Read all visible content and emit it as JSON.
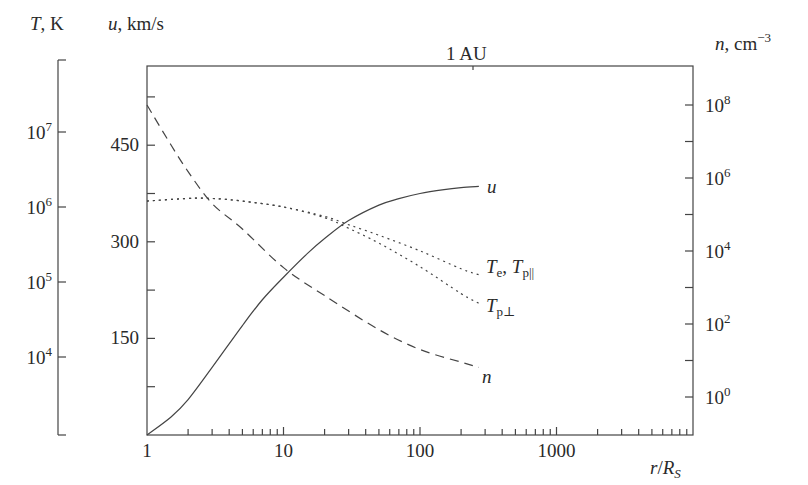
{
  "chart_data": {
    "type": "line",
    "title": "",
    "xlabel": "r/R_S",
    "x_scale": "log",
    "xlim": [
      1,
      10000
    ],
    "x_ticks": [
      "1",
      "10",
      "100",
      "1000"
    ],
    "top_marker": {
      "label": "1 AU",
      "x": 215
    },
    "axes": {
      "T": {
        "label": "T, K",
        "scale": "log",
        "ticks": [
          "10^7",
          "10^6",
          "10^5",
          "10^4"
        ],
        "range": [
          1000,
          100000000
        ]
      },
      "u": {
        "label": "u, km/s",
        "scale": "linear",
        "ticks": [
          "450",
          "300",
          "150"
        ],
        "minor_ticks": [
          75,
          225,
          375,
          525
        ],
        "range": [
          0,
          560
        ]
      },
      "n": {
        "label": "n, cm^-3",
        "scale": "log",
        "ticks": [
          "10^8",
          "10^6",
          "10^4",
          "10^2",
          "10^0"
        ],
        "range": [
          0.1,
          1000000000
        ]
      }
    },
    "series": [
      {
        "name": "u",
        "label": "u",
        "axis": "u",
        "style": "solid",
        "x": [
          1,
          1.5,
          2,
          3,
          5,
          7,
          10,
          15,
          20,
          30,
          50,
          70,
          100,
          150,
          200,
          270
        ],
        "values": [
          0,
          28,
          55,
          105,
          170,
          210,
          245,
          282,
          305,
          333,
          357,
          367,
          375,
          381,
          384,
          386
        ]
      },
      {
        "name": "n",
        "label": "n",
        "axis": "n",
        "style": "dashed",
        "x": [
          1,
          1.5,
          2,
          3,
          5,
          10,
          20,
          50,
          100,
          200,
          270
        ],
        "values": [
          100000000,
          8000000,
          1500000,
          200000,
          40000,
          3500,
          600,
          70,
          20,
          9,
          6.5
        ]
      },
      {
        "name": "Te, Tp_par",
        "label": "T_e, T_p||",
        "axis": "T",
        "style": "dotted",
        "x": [
          1,
          2,
          3,
          5,
          10,
          20,
          30,
          50,
          100,
          200,
          270
        ],
        "values": [
          1200000,
          1300000,
          1300000,
          1200000,
          1000000,
          750000,
          580000,
          420000,
          260000,
          150000,
          125000
        ]
      },
      {
        "name": "Tp_perp",
        "label": "T_p⊥",
        "axis": "T",
        "style": "dotted",
        "x": [
          1,
          2,
          3,
          5,
          10,
          20,
          30,
          50,
          100,
          200,
          270
        ],
        "values": [
          1200000,
          1300000,
          1300000,
          1200000,
          1000000,
          720000,
          520000,
          330000,
          160000,
          70000,
          52000
        ]
      }
    ],
    "grid": false,
    "legend": "inline labels at curve ends",
    "labels": {
      "T_axis_title_var": "T",
      "T_axis_title_unit": ", K",
      "u_axis_title_var": "u",
      "u_axis_title_unit": ", km/s",
      "n_axis_title_var": "n",
      "n_axis_title_unit": ", cm",
      "n_axis_title_exp": "−3",
      "x_axis_r": "r",
      "x_axis_slash": "/",
      "x_axis_R": "R",
      "x_axis_sub": "S",
      "au": "1 AU",
      "u_curve": "u",
      "n_curve": "n",
      "Te_T": "T",
      "Te_sub": "e",
      "Te_comma": ", ",
      "Tp_T": "T",
      "Tp_par_sub": "p||",
      "Tperp_T": "T",
      "Tperp_sub": "p⊥"
    }
  }
}
